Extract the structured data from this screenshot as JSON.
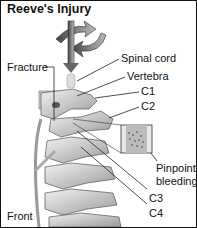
{
  "title": "Reeve's Injury",
  "labels": {
    "spinal_cord": "Spinal cord",
    "fracture": "Fracture",
    "vertebra": "Vertebra",
    "c1": "C1",
    "c2": "C2",
    "pinpoint_line1": "Pinpoint",
    "pinpoint_line2": "bleeding",
    "c3": "C3",
    "c4": "C4",
    "front": "Front"
  }
}
